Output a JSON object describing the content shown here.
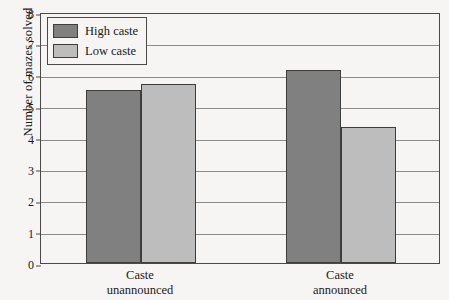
{
  "chart_data": {
    "type": "bar",
    "title": "",
    "xlabel": "",
    "ylabel": "Number of mazes solved",
    "ylim": [
      0,
      8
    ],
    "yticks": [
      0,
      1,
      2,
      3,
      4,
      5,
      6,
      7,
      8
    ],
    "grid": true,
    "legend_position": "top-left",
    "categories": [
      "Caste unannounced",
      "Caste announced"
    ],
    "category_lines": [
      [
        "Caste",
        "unannounced"
      ],
      [
        "Caste",
        "announced"
      ]
    ],
    "series": [
      {
        "name": "High caste",
        "color": "#808080",
        "values": [
          5.5,
          6.15
        ]
      },
      {
        "name": "Low caste",
        "color": "#bdbdbd",
        "values": [
          5.7,
          4.33
        ]
      }
    ]
  },
  "legend": {
    "items": [
      {
        "label": "High caste"
      },
      {
        "label": "Low caste"
      }
    ]
  },
  "axis": {
    "y_title": "Number of mazes solved",
    "y_tick_labels": [
      "0",
      "1",
      "2",
      "3",
      "4",
      "5",
      "6",
      "7",
      "8"
    ]
  },
  "colors": {
    "high_caste": "#808080",
    "low_caste": "#bdbdbd",
    "background": "#f6f5f3",
    "frame": "#4a4a4a",
    "gridline": "#8a8a8a"
  }
}
